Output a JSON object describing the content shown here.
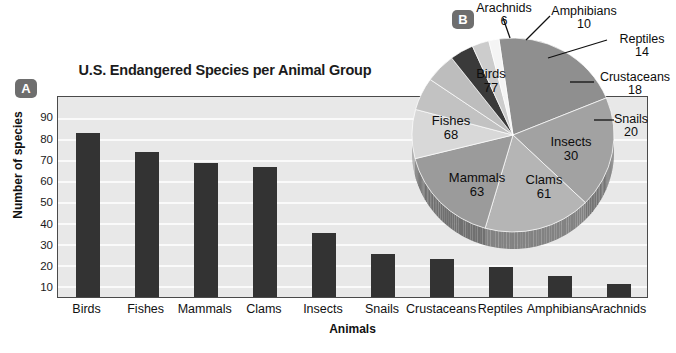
{
  "panels": {
    "a_badge": "A",
    "b_badge": "B"
  },
  "chart_data": [
    {
      "type": "bar",
      "title": "U.S. Endangered Species per Animal Group",
      "xlabel": "Animals",
      "ylabel": "Number of species",
      "categories": [
        "Birds",
        "Fishes",
        "Mammals",
        "Clams",
        "Insects",
        "Snails",
        "Crustaceans",
        "Reptiles",
        "Amphibians",
        "Arachnids"
      ],
      "values": [
        77,
        68,
        63,
        61,
        30,
        20,
        18,
        14,
        10,
        6
      ],
      "yticks": [
        90,
        80,
        70,
        60,
        50,
        40,
        30,
        20,
        10
      ],
      "ylim": [
        0,
        95
      ],
      "grid": true,
      "legend": "none",
      "bar_color": "#333333",
      "plot_bg": "#e8e8e8"
    },
    {
      "type": "pie",
      "title": "",
      "categories": [
        "Birds",
        "Fishes",
        "Mammals",
        "Clams",
        "Insects",
        "Snails",
        "Crustaceans",
        "Reptiles",
        "Amphibians",
        "Arachnids"
      ],
      "values": [
        77,
        68,
        63,
        61,
        30,
        20,
        18,
        14,
        10,
        6
      ],
      "total": 367,
      "slice_colors": [
        "#8f8f8f",
        "#a2a2a2",
        "#b5b5b5",
        "#9b9b9b",
        "#d8d8d8",
        "#c2c2c2",
        "#bdbdbd",
        "#3a3a3a",
        "#cccccc",
        "#f4f4f4"
      ],
      "labels": [
        {
          "name": "Birds",
          "value": "77",
          "placement": "inside"
        },
        {
          "name": "Fishes",
          "value": "68",
          "placement": "inside"
        },
        {
          "name": "Mammals",
          "value": "63",
          "placement": "inside"
        },
        {
          "name": "Clams",
          "value": "61",
          "placement": "inside"
        },
        {
          "name": "Insects",
          "value": "30",
          "placement": "inside"
        },
        {
          "name": "Snails",
          "value": "20",
          "placement": "outside"
        },
        {
          "name": "Crustaceans",
          "value": "18",
          "placement": "outside"
        },
        {
          "name": "Reptiles",
          "value": "14",
          "placement": "outside"
        },
        {
          "name": "Amphibians",
          "value": "10",
          "placement": "outside"
        },
        {
          "name": "Arachnids",
          "value": "6",
          "placement": "outside"
        }
      ]
    }
  ],
  "bar_labels": {
    "y_90": "90",
    "y_80": "80",
    "y_70": "70",
    "y_60": "60",
    "y_50": "50",
    "y_40": "40",
    "y_30": "30",
    "y_20": "20",
    "y_10": "10",
    "x_0": "Birds",
    "x_1": "Fishes",
    "x_2": "Mammals",
    "x_3": "Clams",
    "x_4": "Insects",
    "x_5": "Snails",
    "x_6": "Crustaceans",
    "x_7": "Reptiles",
    "x_8": "Amphibians",
    "x_9": "Arachnids"
  },
  "pie_labels": {
    "birds_name": "Birds",
    "birds_val": "77",
    "fishes_name": "Fishes",
    "fishes_val": "68",
    "mammals_name": "Mammals",
    "mammals_val": "63",
    "clams_name": "Clams",
    "clams_val": "61",
    "insects_name": "Insects",
    "insects_val": "30",
    "snails_name": "Snails",
    "snails_val": "20",
    "crustaceans_name": "Crustaceans",
    "crustaceans_val": "18",
    "reptiles_name": "Reptiles",
    "reptiles_val": "14",
    "amphibians_name": "Amphibians",
    "amphibians_val": "10",
    "arachnids_name": "Arachnids",
    "arachnids_val": "6"
  }
}
